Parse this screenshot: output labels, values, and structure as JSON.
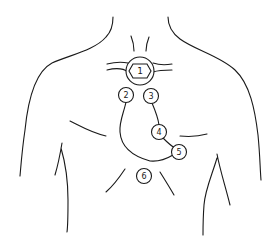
{
  "figure": {
    "line_color": "#1a1a1a",
    "background": "#ffffff"
  },
  "markers": [
    {
      "id": 1,
      "label": "1",
      "shape": "circle with inner hexagon",
      "position": "suprasternal notch / base of neck"
    },
    {
      "id": 2,
      "label": "2",
      "shape": "circle",
      "position": "right upper sternal border"
    },
    {
      "id": 3,
      "label": "3",
      "shape": "circle",
      "position": "left upper sternal border"
    },
    {
      "id": 4,
      "label": "4",
      "shape": "circle",
      "position": "left lower sternal area"
    },
    {
      "id": 5,
      "label": "5",
      "shape": "circle",
      "position": "apex / left midclavicular"
    },
    {
      "id": 6,
      "label": "6",
      "shape": "circle",
      "position": "epigastric / below sternum"
    }
  ]
}
